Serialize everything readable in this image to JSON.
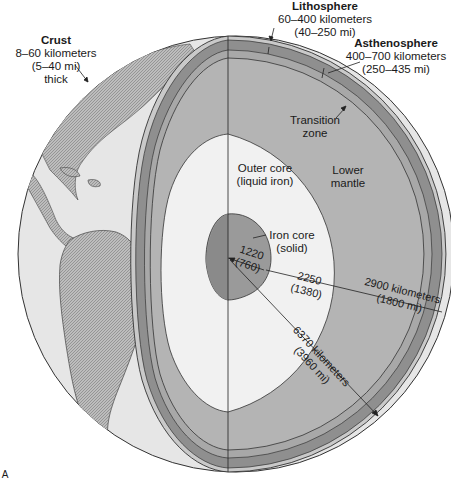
{
  "figure_label": "A",
  "colors": {
    "background": "#ffffff",
    "globe_surface": "#e6e6e6",
    "land": "#b9b9b9",
    "crust": "#c9c9c9",
    "lithosphere_band": "#8f8f8f",
    "asthenosphere_band": "#a8a8a8",
    "mantle": "#b4b4b4",
    "outer_core": "#f1f1f1",
    "inner_core": "#9a9a9a",
    "line": "#222222"
  },
  "labels": {
    "crust": {
      "title": "Crust",
      "line1": "8–60 kilometers",
      "line2": "(5–40 mi)",
      "line3": "thick"
    },
    "lithosphere": {
      "title": "Lithosphere",
      "line1": "60–400 kilometers",
      "line2": "(40–250 mi)"
    },
    "asthenosphere": {
      "title": "Asthenosphere",
      "line1": "400–700 kilometers",
      "line2": "(250–435 mi)"
    },
    "transition_zone": {
      "line1": "Transition",
      "line2": "zone"
    },
    "outer_core": {
      "line1": "Outer core",
      "line2": "(liquid iron)"
    },
    "lower_mantle": {
      "line1": "Lower",
      "line2": "mantle"
    },
    "iron_core": {
      "line1": "Iron core",
      "line2": "(solid)"
    },
    "inner_radius": {
      "line1": "1220",
      "line2": "(760)"
    },
    "outer_core_thickness": {
      "line1": "2250",
      "line2": "(1380)"
    },
    "mantle_thickness": {
      "line1": "2900 kilometers",
      "line2": "(1800 mi)"
    },
    "earth_radius": {
      "line1": "6370 kilometers",
      "line2": "(3960 mi)"
    }
  }
}
